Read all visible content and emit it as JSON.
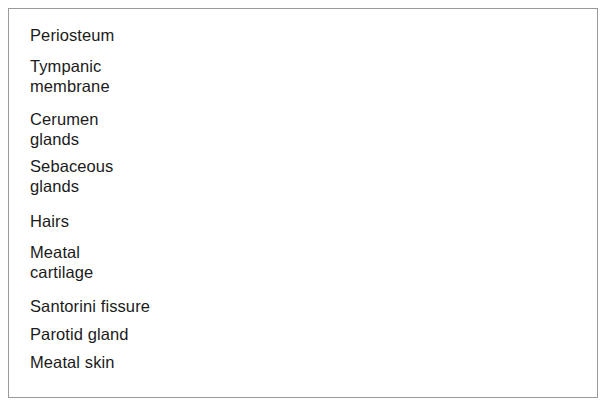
{
  "figure": {
    "border_color": "#9a9a9a",
    "background_color": "#ffffff",
    "line_color": "#2b2b2b",
    "text_color": "#1b1b1b"
  },
  "labels": [
    {
      "id": "periosteum",
      "text": "Periosteum",
      "x": 30,
      "y": 26
    },
    {
      "id": "tympanic",
      "text": "Tympanic",
      "x": 30,
      "y": 57
    },
    {
      "id": "tympanic2",
      "text": "membrane",
      "x": 30,
      "y": 77
    },
    {
      "id": "cerumen",
      "text": "Cerumen",
      "x": 30,
      "y": 110
    },
    {
      "id": "cerumen2",
      "text": "glands",
      "x": 30,
      "y": 130
    },
    {
      "id": "sebaceous",
      "text": "Sebaceous",
      "x": 30,
      "y": 157
    },
    {
      "id": "sebaceous2",
      "text": "glands",
      "x": 30,
      "y": 177
    },
    {
      "id": "hairs",
      "text": "Hairs",
      "x": 30,
      "y": 212
    },
    {
      "id": "meatal-cartilage",
      "text": "Meatal",
      "x": 30,
      "y": 243
    },
    {
      "id": "meatal-cartilage2",
      "text": "cartilage",
      "x": 30,
      "y": 263
    },
    {
      "id": "santorini",
      "text": "Santorini fissure",
      "x": 30,
      "y": 297
    },
    {
      "id": "parotid",
      "text": "Parotid gland",
      "x": 30,
      "y": 325
    },
    {
      "id": "meatal-skin",
      "text": "Meatal skin",
      "x": 30,
      "y": 353
    }
  ],
  "anatomy": {
    "structures": [
      "periosteum",
      "tympanic membrane",
      "cerumen glands",
      "sebaceous glands",
      "hairs",
      "meatal cartilage",
      "Santorini fissure",
      "parotid gland",
      "meatal skin"
    ],
    "palette": {
      "skin_light": "#e8e7e3",
      "dermis": "#b9b8b4",
      "cartilage": "#c9c8c4",
      "bone_light": "#dedcd6",
      "bone_marrow": "#b4b2ad",
      "canal_dark": "#8e8d8a",
      "canal_mid": "#a8a7a4",
      "canal_light": "#dbdad7",
      "outline": "#6a6967",
      "parotid": "#c4c3bf"
    }
  }
}
